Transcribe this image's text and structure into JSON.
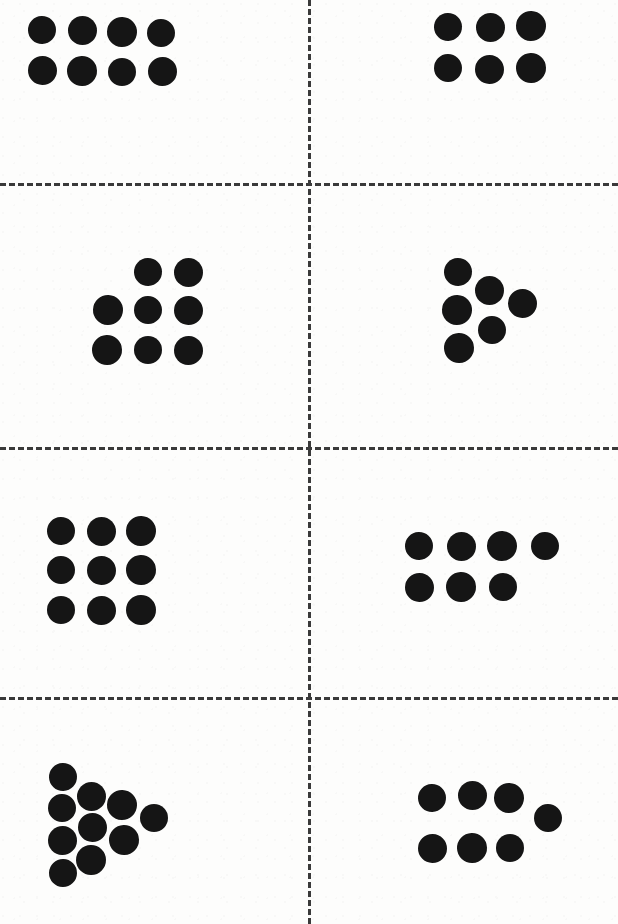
{
  "page": {
    "width": 618,
    "height": 924,
    "background_color": "#fdfdfc",
    "dot_color": "#151515",
    "divider_color": "#3a3a3a",
    "dot_diameter": 29,
    "panel_count": 8
  },
  "dividers": {
    "horizontal_y": [
      183,
      447,
      697
    ],
    "vertical_x": [
      308
    ],
    "style": "dashed",
    "thickness": 3,
    "dash_length": 13,
    "gap_length": 7
  },
  "chart_data": {
    "type": "scatter",
    "xlabel": "",
    "ylabel": "",
    "xlim": [
      0,
      618
    ],
    "ylim": [
      0,
      924
    ],
    "grid": false,
    "legend": false,
    "marker": "filled-circle",
    "marker_size": 29,
    "marker_color": "#151515",
    "panels": [
      {
        "id": "panel-1",
        "position": "top-left",
        "row": 1,
        "column": 1,
        "count": 8,
        "arrangement": "2 rows of 4",
        "points": [
          {
            "x": 42,
            "y": 30
          },
          {
            "x": 82,
            "y": 30
          },
          {
            "x": 122,
            "y": 32
          },
          {
            "x": 161,
            "y": 33
          },
          {
            "x": 42,
            "y": 70
          },
          {
            "x": 82,
            "y": 71
          },
          {
            "x": 122,
            "y": 72
          },
          {
            "x": 162,
            "y": 71
          }
        ]
      },
      {
        "id": "panel-2",
        "position": "top-right",
        "row": 1,
        "column": 2,
        "count": 6,
        "arrangement": "2 rows of 3",
        "points": [
          {
            "x": 448,
            "y": 27
          },
          {
            "x": 490,
            "y": 27
          },
          {
            "x": 531,
            "y": 26
          },
          {
            "x": 448,
            "y": 68
          },
          {
            "x": 489,
            "y": 69
          },
          {
            "x": 531,
            "y": 68
          }
        ]
      },
      {
        "id": "panel-3",
        "position": "middle-upper-left",
        "row": 2,
        "column": 1,
        "count": 8,
        "arrangement": "top row of 2 offset right, then 2 rows of 3",
        "points": [
          {
            "x": 148,
            "y": 272
          },
          {
            "x": 188,
            "y": 272
          },
          {
            "x": 108,
            "y": 310
          },
          {
            "x": 148,
            "y": 310
          },
          {
            "x": 188,
            "y": 310
          },
          {
            "x": 107,
            "y": 350
          },
          {
            "x": 148,
            "y": 350
          },
          {
            "x": 188,
            "y": 350
          }
        ]
      },
      {
        "id": "panel-4",
        "position": "middle-upper-right",
        "row": 2,
        "column": 2,
        "count": 6,
        "arrangement": "triangular arrowhead cluster",
        "points": [
          {
            "x": 458,
            "y": 272
          },
          {
            "x": 489,
            "y": 290
          },
          {
            "x": 457,
            "y": 310
          },
          {
            "x": 492,
            "y": 330
          },
          {
            "x": 522,
            "y": 303
          },
          {
            "x": 459,
            "y": 348
          }
        ]
      },
      {
        "id": "panel-5",
        "position": "middle-lower-left",
        "row": 3,
        "column": 1,
        "count": 9,
        "arrangement": "3 by 3 square grid",
        "points": [
          {
            "x": 61,
            "y": 531
          },
          {
            "x": 101,
            "y": 531
          },
          {
            "x": 141,
            "y": 531
          },
          {
            "x": 61,
            "y": 570
          },
          {
            "x": 101,
            "y": 570
          },
          {
            "x": 141,
            "y": 570
          },
          {
            "x": 61,
            "y": 610
          },
          {
            "x": 101,
            "y": 610
          },
          {
            "x": 141,
            "y": 610
          }
        ]
      },
      {
        "id": "panel-6",
        "position": "middle-lower-right",
        "row": 3,
        "column": 2,
        "count": 7,
        "arrangement": "top row of 4, bottom row of 3",
        "points": [
          {
            "x": 419,
            "y": 546
          },
          {
            "x": 461,
            "y": 546
          },
          {
            "x": 502,
            "y": 546
          },
          {
            "x": 545,
            "y": 546
          },
          {
            "x": 419,
            "y": 587
          },
          {
            "x": 461,
            "y": 587
          },
          {
            "x": 503,
            "y": 587
          }
        ]
      },
      {
        "id": "panel-7",
        "position": "bottom-left",
        "row": 4,
        "column": 1,
        "count": 10,
        "arrangement": "triangular arrowhead cluster",
        "points": [
          {
            "x": 63,
            "y": 777
          },
          {
            "x": 91,
            "y": 796
          },
          {
            "x": 122,
            "y": 805
          },
          {
            "x": 62,
            "y": 808
          },
          {
            "x": 92,
            "y": 827
          },
          {
            "x": 124,
            "y": 840
          },
          {
            "x": 154,
            "y": 818
          },
          {
            "x": 62,
            "y": 840
          },
          {
            "x": 91,
            "y": 860
          },
          {
            "x": 63,
            "y": 873
          }
        ]
      },
      {
        "id": "panel-8",
        "position": "bottom-right",
        "row": 4,
        "column": 2,
        "count": 7,
        "arrangement": "top row of 3 plus offset dot, bottom row of 3",
        "points": [
          {
            "x": 432,
            "y": 798
          },
          {
            "x": 472,
            "y": 795
          },
          {
            "x": 509,
            "y": 798
          },
          {
            "x": 548,
            "y": 818
          },
          {
            "x": 432,
            "y": 848
          },
          {
            "x": 472,
            "y": 848
          },
          {
            "x": 510,
            "y": 848
          }
        ]
      }
    ]
  }
}
